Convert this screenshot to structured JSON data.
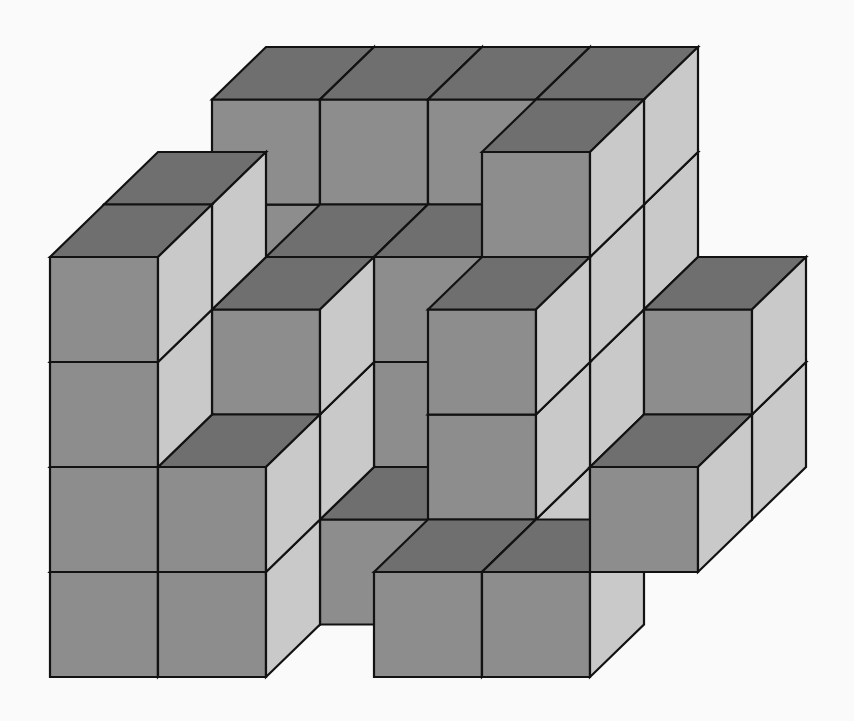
{
  "figure": {
    "title": "3D cube stack",
    "background": "#fafafa",
    "colors": {
      "top": "#6f6f6f",
      "front": "#8d8d8d",
      "side": "#c9c9c9",
      "edge": "#121212"
    },
    "projection": {
      "origin_x": 50,
      "ground_y": 677,
      "unit_x": 108,
      "unit_y": 105,
      "depth_dx": 54,
      "depth_dy": -52.5
    },
    "cube_count_visible_model": 46,
    "cubes": [
      [
        0,
        3,
        0
      ],
      [
        0,
        3,
        1
      ],
      [
        0,
        3,
        2
      ],
      [
        0,
        3,
        3
      ],
      [
        1,
        3,
        0
      ],
      [
        1,
        3,
        1
      ],
      [
        1,
        3,
        2
      ],
      [
        1,
        3,
        3
      ],
      [
        2,
        3,
        0
      ],
      [
        2,
        3,
        1
      ],
      [
        2,
        3,
        2
      ],
      [
        2,
        3,
        3
      ],
      [
        3,
        3,
        0
      ],
      [
        3,
        3,
        1
      ],
      [
        3,
        3,
        2
      ],
      [
        3,
        3,
        3
      ],
      [
        1,
        2,
        0
      ],
      [
        1,
        2,
        1
      ],
      [
        1,
        2,
        2
      ],
      [
        2,
        2,
        0
      ],
      [
        2,
        2,
        1
      ],
      [
        2,
        2,
        2
      ],
      [
        3,
        2,
        0
      ],
      [
        3,
        2,
        1
      ],
      [
        3,
        2,
        2
      ],
      [
        3,
        2,
        3
      ],
      [
        0,
        1,
        0
      ],
      [
        0,
        1,
        1
      ],
      [
        0,
        1,
        2
      ],
      [
        0,
        1,
        3
      ],
      [
        1,
        1,
        0
      ],
      [
        1,
        1,
        1
      ],
      [
        1,
        1,
        2
      ],
      [
        2,
        1,
        0
      ],
      [
        3,
        1,
        0
      ],
      [
        3,
        1,
        1
      ],
      [
        3,
        1,
        2
      ],
      [
        5,
        1,
        1
      ],
      [
        5,
        1,
        2
      ],
      [
        0,
        0,
        0
      ],
      [
        0,
        0,
        1
      ],
      [
        0,
        0,
        2
      ],
      [
        0,
        0,
        3
      ],
      [
        1,
        0,
        0
      ],
      [
        1,
        0,
        1
      ],
      [
        3,
        0,
        0
      ],
      [
        4,
        0,
        0
      ],
      [
        5,
        0,
        1
      ]
    ]
  }
}
